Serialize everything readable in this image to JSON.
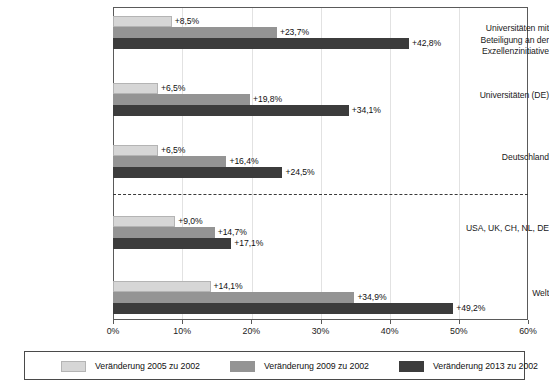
{
  "chart_data": {
    "type": "bar",
    "orientation": "horizontal",
    "title": "",
    "xlabel": "",
    "ylabel": "",
    "xlim": [
      0,
      60
    ],
    "xunit": "%",
    "grid": true,
    "legend_position": "bottom",
    "categories": [
      "Universitäten mit Beteiligung an der Exzellenzinitiative",
      "Universitäten (DE)",
      "Deutschland",
      "USA, UK, CH, NL, DE",
      "Welt"
    ],
    "category_lines": [
      [
        "Universitäten mit",
        "Beteiligung an der",
        "Exzellenzinitiative"
      ],
      [
        "Universitäten (DE)"
      ],
      [
        "Deutschland"
      ],
      [
        "USA, UK, CH, NL, DE"
      ],
      [
        "Welt"
      ]
    ],
    "series": [
      {
        "name": "Veränderung 2005 zu 2002",
        "color": "#d6d6d6",
        "values": [
          8.5,
          6.5,
          6.5,
          9.0,
          14.1
        ],
        "labels": [
          "+8,5%",
          "+6,5%",
          "+6,5%",
          "+9,0%",
          "+14,1%"
        ]
      },
      {
        "name": "Veränderung 2009 zu 2002",
        "color": "#949494",
        "values": [
          23.7,
          19.8,
          16.4,
          14.7,
          34.9
        ],
        "labels": [
          "+23,7%",
          "+19,8%",
          "+16,4%",
          "+14,7%",
          "+34,9%"
        ]
      },
      {
        "name": "Veränderung 2013 zu 2002",
        "color": "#3c3c3c",
        "values": [
          42.8,
          34.1,
          24.5,
          17.1,
          49.2
        ],
        "labels": [
          "+42,8%",
          "+34,1%",
          "+24,5%",
          "+17,1%",
          "+49,2%"
        ]
      }
    ],
    "xticks": [
      0,
      10,
      20,
      30,
      40,
      50,
      60
    ],
    "xtick_labels": [
      "0%",
      "10%",
      "20%",
      "30%",
      "40%",
      "50%",
      "60%"
    ],
    "separator": {
      "style": "dashed",
      "after_category_index": 2
    }
  },
  "legend": {
    "items": [
      {
        "label": "Veränderung 2005 zu 2002",
        "swatch": "series-0-swatch"
      },
      {
        "label": "Veränderung 2009 zu 2002",
        "swatch": "series-1-swatch"
      },
      {
        "label": "Veränderung 2013 zu 2002",
        "swatch": "series-2-swatch"
      }
    ]
  }
}
